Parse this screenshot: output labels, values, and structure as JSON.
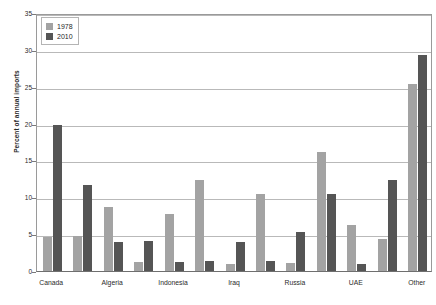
{
  "chart_data": {
    "type": "bar",
    "title": "",
    "xlabel": "",
    "ylabel": "Percent of annual imports",
    "ylim": [
      0,
      35
    ],
    "yticks": [
      0,
      5,
      10,
      15,
      20,
      25,
      30,
      35
    ],
    "grid": true,
    "legend_position": "top-left",
    "categories": [
      "Canada",
      "",
      "Algeria",
      "",
      "Indonesia",
      "",
      "Iraq",
      "",
      "Russia",
      "",
      "UAE",
      "",
      "Other"
    ],
    "tick_labels": [
      "Canada",
      "Algeria",
      "Indonesia",
      "Iraq",
      "Russia",
      "UAE",
      "Other"
    ],
    "series": [
      {
        "name": "1978",
        "color": "#a3a3a3",
        "values": [
          4.6,
          4.7,
          8.7,
          1.2,
          7.8,
          12.4,
          1.0,
          10.4,
          1.1,
          16.2,
          6.3,
          4.4,
          25.4
        ]
      },
      {
        "name": "2010",
        "color": "#555555",
        "values": [
          19.8,
          11.7,
          3.9,
          4.1,
          1.2,
          1.3,
          4.0,
          1.3,
          5.3,
          10.4,
          1.0,
          12.3,
          29.3
        ]
      }
    ]
  },
  "legend": {
    "entries": [
      {
        "label": "1978",
        "swatch": "legend-swatch-1978"
      },
      {
        "label": "2010",
        "swatch": "legend-swatch-2010"
      }
    ]
  },
  "axis": {
    "y_title": "Percent of annual imports",
    "y_tick_0": "0",
    "y_tick_5": "5",
    "y_tick_10": "10",
    "y_tick_15": "15",
    "y_tick_20": "20",
    "y_tick_25": "25",
    "y_tick_30": "30",
    "y_tick_35": "35"
  },
  "xaxis": {
    "labels": [
      "Canada",
      "Algeria",
      "Indonesia",
      "Iraq",
      "Russia",
      "UAE",
      "Other"
    ]
  }
}
